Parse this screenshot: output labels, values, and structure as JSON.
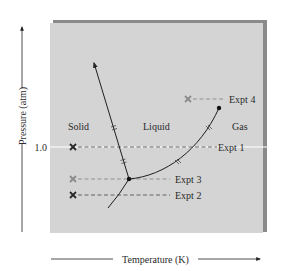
{
  "diagram": {
    "type": "phase-diagram",
    "axes": {
      "x_label": "Temperature (K)",
      "y_label": "Pressure (atm)",
      "y_tick": "1.0"
    },
    "regions": {
      "solid": "Solid",
      "liquid": "Liquid",
      "gas": "Gas"
    },
    "experiments": [
      {
        "label": "Expt 1",
        "marker": "x",
        "marker_color": "#2a2a2a"
      },
      {
        "label": "Expt 2",
        "marker": "x",
        "marker_color": "#2a2a2a"
      },
      {
        "label": "Expt 3",
        "marker": "x",
        "marker_color": "#8c8c8c"
      },
      {
        "label": "Expt 4",
        "marker": "x",
        "marker_color": "#8c8c8c"
      }
    ],
    "colors": {
      "panel": "#d4d4d4",
      "panel_shadow": "#7a7a7a",
      "curve": "#1e1e1e",
      "pressure_line": "#ffffff"
    }
  }
}
